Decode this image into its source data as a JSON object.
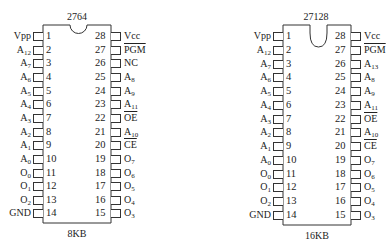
{
  "chips": [
    {
      "id": "2764",
      "part_number": "2764",
      "capacity": "8KB",
      "notch": "shallow",
      "left_pins": [
        {
          "num": "1",
          "base": "Vpp",
          "sub": "",
          "overline": false
        },
        {
          "num": "2",
          "base": "A",
          "sub": "12",
          "overline": false
        },
        {
          "num": "3",
          "base": "A",
          "sub": "7",
          "overline": false
        },
        {
          "num": "4",
          "base": "A",
          "sub": "6",
          "overline": false
        },
        {
          "num": "5",
          "base": "A",
          "sub": "5",
          "overline": false
        },
        {
          "num": "6",
          "base": "A",
          "sub": "4",
          "overline": false
        },
        {
          "num": "7",
          "base": "A",
          "sub": "3",
          "overline": false
        },
        {
          "num": "8",
          "base": "A",
          "sub": "2",
          "overline": false
        },
        {
          "num": "9",
          "base": "A",
          "sub": "1",
          "overline": false
        },
        {
          "num": "10",
          "base": "A",
          "sub": "0",
          "overline": false
        },
        {
          "num": "11",
          "base": "O",
          "sub": "0",
          "overline": false
        },
        {
          "num": "12",
          "base": "O",
          "sub": "1",
          "overline": false
        },
        {
          "num": "13",
          "base": "O",
          "sub": "2",
          "overline": false
        },
        {
          "num": "14",
          "base": "GND",
          "sub": "",
          "overline": false
        }
      ],
      "right_pins": [
        {
          "num": "28",
          "base": "Vcc",
          "sub": "",
          "overline": false
        },
        {
          "num": "27",
          "base": "PGM",
          "sub": "",
          "overline": true
        },
        {
          "num": "26",
          "base": "NC",
          "sub": "",
          "overline": false
        },
        {
          "num": "25",
          "base": "A",
          "sub": "8",
          "overline": false
        },
        {
          "num": "24",
          "base": "A",
          "sub": "9",
          "overline": false
        },
        {
          "num": "23",
          "base": "A",
          "sub": "11",
          "overline": false
        },
        {
          "num": "22",
          "base": "OE",
          "sub": "",
          "overline": true
        },
        {
          "num": "21",
          "base": "A",
          "sub": "10",
          "overline": false
        },
        {
          "num": "20",
          "base": "CE",
          "sub": "",
          "overline": true
        },
        {
          "num": "19",
          "base": "O",
          "sub": "7",
          "overline": false
        },
        {
          "num": "18",
          "base": "O",
          "sub": "6",
          "overline": false
        },
        {
          "num": "17",
          "base": "O",
          "sub": "5",
          "overline": false
        },
        {
          "num": "16",
          "base": "O",
          "sub": "4",
          "overline": false
        },
        {
          "num": "15",
          "base": "O",
          "sub": "3",
          "overline": false
        }
      ]
    },
    {
      "id": "27128",
      "part_number": "27128",
      "capacity": "16KB",
      "notch": "deep",
      "left_pins": [
        {
          "num": "1",
          "base": "Vpp",
          "sub": "",
          "overline": false
        },
        {
          "num": "2",
          "base": "A",
          "sub": "12",
          "overline": false
        },
        {
          "num": "3",
          "base": "A",
          "sub": "7",
          "overline": false
        },
        {
          "num": "4",
          "base": "A",
          "sub": "6",
          "overline": false
        },
        {
          "num": "5",
          "base": "A",
          "sub": "5",
          "overline": false
        },
        {
          "num": "6",
          "base": "A",
          "sub": "4",
          "overline": false
        },
        {
          "num": "7",
          "base": "A",
          "sub": "3",
          "overline": false
        },
        {
          "num": "8",
          "base": "A",
          "sub": "2",
          "overline": false
        },
        {
          "num": "9",
          "base": "A",
          "sub": "1",
          "overline": false
        },
        {
          "num": "10",
          "base": "A",
          "sub": "0",
          "overline": false
        },
        {
          "num": "11",
          "base": "O",
          "sub": "0",
          "overline": false
        },
        {
          "num": "12",
          "base": "O",
          "sub": "1",
          "overline": false
        },
        {
          "num": "13",
          "base": "O",
          "sub": "2",
          "overline": false
        },
        {
          "num": "14",
          "base": "GND",
          "sub": "",
          "overline": false
        }
      ],
      "right_pins": [
        {
          "num": "28",
          "base": "Vcc",
          "sub": "",
          "overline": false
        },
        {
          "num": "27",
          "base": "PGM",
          "sub": "",
          "overline": true
        },
        {
          "num": "26",
          "base": "A",
          "sub": "13",
          "overline": false
        },
        {
          "num": "25",
          "base": "A",
          "sub": "8",
          "overline": false
        },
        {
          "num": "24",
          "base": "A",
          "sub": "9",
          "overline": false
        },
        {
          "num": "23",
          "base": "A",
          "sub": "11",
          "overline": false
        },
        {
          "num": "22",
          "base": "OE",
          "sub": "",
          "overline": true
        },
        {
          "num": "21",
          "base": "A",
          "sub": "10",
          "overline": false
        },
        {
          "num": "20",
          "base": "CE",
          "sub": "",
          "overline": true
        },
        {
          "num": "19",
          "base": "O",
          "sub": "7",
          "overline": false
        },
        {
          "num": "18",
          "base": "O",
          "sub": "6",
          "overline": false
        },
        {
          "num": "17",
          "base": "O",
          "sub": "5",
          "overline": false
        },
        {
          "num": "16",
          "base": "O",
          "sub": "4",
          "overline": false
        },
        {
          "num": "15",
          "base": "O",
          "sub": "3",
          "overline": false
        }
      ]
    }
  ],
  "colors": {
    "line": "#333333",
    "text": "#222222",
    "background": "#ffffff"
  }
}
